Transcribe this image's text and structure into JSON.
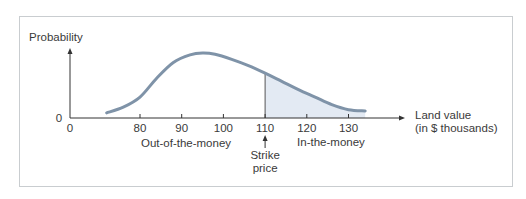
{
  "chart_data": {
    "type": "area",
    "title": "",
    "ylabel": "Probability",
    "xlabel": "Land value\n(in $ thousands)",
    "xlabel_lines": [
      "Land value",
      "(in $ thousands)"
    ],
    "x_origin_label": "0",
    "y_origin_label": "0",
    "x_ticks": [
      80,
      90,
      100,
      110,
      120,
      130
    ],
    "x_tick_labels": [
      "80",
      "90",
      "100",
      "110",
      "120",
      "130"
    ],
    "xlim": [
      72,
      136
    ],
    "curve": {
      "x": [
        72,
        76,
        80,
        84,
        88,
        92,
        95,
        98,
        102,
        106,
        110,
        114,
        118,
        122,
        126,
        130,
        134
      ],
      "y": [
        0.05,
        0.14,
        0.3,
        0.6,
        0.85,
        0.97,
        1.0,
        0.98,
        0.9,
        0.8,
        0.68,
        0.55,
        0.42,
        0.3,
        0.18,
        0.1,
        0.08
      ]
    },
    "ylim": [
      0,
      1.1
    ],
    "shaded_from_x": 110,
    "strike_price": 110,
    "annotations": {
      "out_of_the_money": "Out-of-the-money",
      "in_the_money": "In-the-money",
      "strike_label_lines": [
        "Strike",
        "price"
      ]
    },
    "colors": {
      "curve": "#7f93a8",
      "shade": "#e3eaf3",
      "axis": "#333333"
    }
  }
}
